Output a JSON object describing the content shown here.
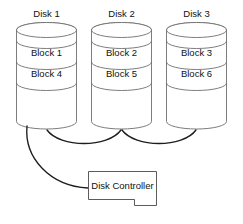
{
  "diagram": {
    "background_color": "#ffffff",
    "outline_color": "#6e6e6e",
    "link_color": "#1d1d1d",
    "text_color": "#111111",
    "disks": [
      {
        "id": "disk-1",
        "label": "Disk 1",
        "blocks": [
          "Block 1",
          "Block 4"
        ],
        "x": 16,
        "width": 61,
        "top": 24,
        "bottom": 128
      },
      {
        "id": "disk-2",
        "label": "Disk 2",
        "blocks": [
          "Block 2",
          "Block 5"
        ],
        "x": 91,
        "width": 61,
        "top": 24,
        "bottom": 128
      },
      {
        "id": "disk-3",
        "label": "Disk 3",
        "blocks": [
          "Block 3",
          "Block 6"
        ],
        "x": 166,
        "width": 61,
        "top": 24,
        "bottom": 128
      }
    ],
    "controller": {
      "id": "disk-controller",
      "label": "Disk Controller",
      "x": 88,
      "y": 171,
      "width": 69,
      "height": 34,
      "notch_x": 134,
      "notch_depth": 6
    },
    "connections": [
      {
        "id": "link-disk1-controller",
        "from": "disk-1",
        "to": "disk-controller"
      },
      {
        "id": "link-disk1-disk2",
        "from": "disk-1",
        "to": "disk-2"
      },
      {
        "id": "link-disk2-disk3",
        "from": "disk-2",
        "to": "disk-3"
      }
    ]
  }
}
